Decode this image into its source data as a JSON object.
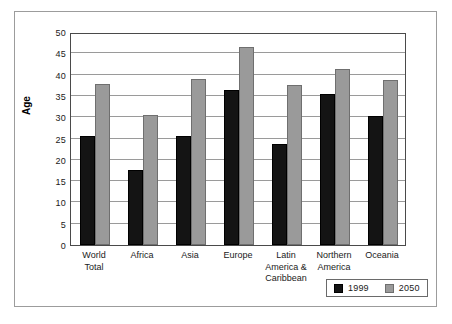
{
  "chart_data": {
    "type": "bar",
    "title": "",
    "xlabel": "",
    "ylabel": "Age",
    "ylim": [
      0,
      50
    ],
    "ytick_step": 5,
    "yticks": [
      50,
      45,
      40,
      35,
      30,
      25,
      20,
      15,
      10,
      5,
      0
    ],
    "grid": true,
    "legend_position": "bottom-right",
    "categories": [
      "World Total",
      "Africa",
      "Asia",
      "Europe",
      "Latin America & Caribbean",
      "Northern America",
      "Oceania"
    ],
    "category_lines": [
      [
        "World",
        "Total"
      ],
      [
        "Africa"
      ],
      [
        "Asia"
      ],
      [
        "Europe"
      ],
      [
        "Latin",
        "America &",
        "Caribbean"
      ],
      [
        "Northern",
        "America"
      ],
      [
        "Oceania"
      ]
    ],
    "series": [
      {
        "name": "1999",
        "color": "#141414",
        "values": [
          25.5,
          17.5,
          25.6,
          36.5,
          23.7,
          35.4,
          30.2
        ]
      },
      {
        "name": "2050",
        "color": "#9a9a9a",
        "values": [
          37.8,
          30.5,
          38.9,
          46.4,
          37.6,
          41.3,
          38.8
        ]
      }
    ]
  },
  "legend": {
    "entries": [
      {
        "label": "1999",
        "swatch": "black-square-swatch"
      },
      {
        "label": "2050",
        "swatch": "gray-square-swatch"
      }
    ]
  },
  "axis": {
    "y_title": "Age"
  }
}
